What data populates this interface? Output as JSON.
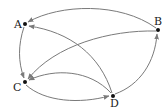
{
  "diagram": {
    "type": "directed-graph",
    "nodes": [
      {
        "id": "A",
        "label": "A",
        "x": 25,
        "y": 24
      },
      {
        "id": "B",
        "label": "B",
        "x": 158,
        "y": 30
      },
      {
        "id": "C",
        "label": "C",
        "x": 25,
        "y": 82
      },
      {
        "id": "D",
        "label": "D",
        "x": 113,
        "y": 96
      }
    ],
    "edges": [
      {
        "from": "B",
        "to": "A"
      },
      {
        "from": "D",
        "to": "A"
      },
      {
        "from": "A",
        "to": "C"
      },
      {
        "from": "B",
        "to": "C"
      },
      {
        "from": "D",
        "to": "C"
      },
      {
        "from": "C",
        "to": "D"
      },
      {
        "from": "D",
        "to": "B"
      }
    ],
    "colors": {
      "edge": "#7a7a7a",
      "node": "#111111",
      "label": "#222222"
    }
  }
}
